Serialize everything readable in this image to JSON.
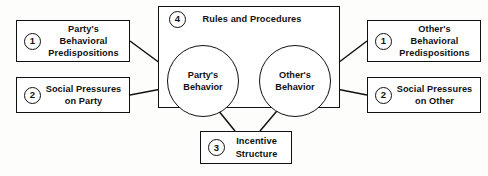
{
  "diagram": {
    "container": {
      "number": "4",
      "label": "Rules and Procedures"
    },
    "nodes": {
      "party_predispositions": {
        "number": "1",
        "label": "Party's\nBehavioral\nPredispositions"
      },
      "social_pressures_party": {
        "number": "2",
        "label": "Social Pressures\non Party"
      },
      "other_predispositions": {
        "number": "1",
        "label": "Other's\nBehavioral\nPredispositions"
      },
      "social_pressures_other": {
        "number": "2",
        "label": "Social Pressures\non Other"
      },
      "incentive_structure": {
        "number": "3",
        "label": "Incentive\nStructure"
      },
      "party_behavior": {
        "label": "Party's\nBehavior"
      },
      "other_behavior": {
        "label": "Other's\nBehavior"
      }
    },
    "edges": [
      {
        "name": "party-predispositions-to-party-behavior",
        "from": "party_predispositions",
        "to": "party_behavior",
        "style": "straight-arrow"
      },
      {
        "name": "social-pressures-party-to-party-behavior",
        "from": "social_pressures_party",
        "to": "party_behavior",
        "style": "straight-arrow"
      },
      {
        "name": "other-predispositions-to-other-behavior",
        "from": "other_predispositions",
        "to": "other_behavior",
        "style": "straight-arrow"
      },
      {
        "name": "social-pressures-other-to-other-behavior",
        "from": "social_pressures_other",
        "to": "other_behavior",
        "style": "straight-arrow"
      },
      {
        "name": "incentive-structure-to-party-behavior",
        "from": "incentive_structure",
        "to": "party_behavior",
        "style": "straight-arrow"
      },
      {
        "name": "incentive-structure-to-other-behavior",
        "from": "incentive_structure",
        "to": "other_behavior",
        "style": "straight-arrow"
      },
      {
        "name": "other-behavior-to-party-behavior",
        "from": "other_behavior",
        "to": "party_behavior",
        "style": "curved-arrow-top"
      },
      {
        "name": "party-behavior-to-other-behavior",
        "from": "party_behavior",
        "to": "other_behavior",
        "style": "curved-arrow-bottom"
      }
    ],
    "colors": {
      "stroke": "#111111",
      "fill": "#ffffff",
      "background": "#fdfdfc"
    }
  }
}
